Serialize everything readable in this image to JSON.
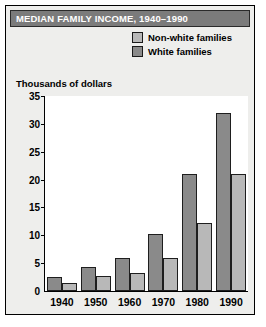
{
  "title": "MEDIAN FAMILY INCOME, 1940–1990",
  "legend": {
    "items": [
      {
        "label": "Non-white families",
        "color": "#b8b8b8"
      },
      {
        "label": "White families",
        "color": "#8a8a8a"
      }
    ]
  },
  "axis": {
    "ylabel": "Thousands of dollars",
    "yticks": [
      "0",
      "5",
      "10",
      "15",
      "20",
      "25",
      "30",
      "35"
    ]
  },
  "chart_data": {
    "type": "bar",
    "title": "MEDIAN FAMILY INCOME, 1940–1990",
    "xlabel": "",
    "ylabel": "Thousands of dollars",
    "ylim": [
      0,
      35
    ],
    "ytick_step": 5,
    "grid": false,
    "legend_position": "top-right",
    "bar_order_within_group": [
      "White families",
      "Non-white families"
    ],
    "categories": [
      "1940",
      "1950",
      "1960",
      "1970",
      "1980",
      "1990"
    ],
    "series": [
      {
        "name": "White families",
        "color": "#8a8a8a",
        "values": [
          2.5,
          4.3,
          6.0,
          10.2,
          21.0,
          32.0
        ]
      },
      {
        "name": "Non-white families",
        "color": "#b8b8b8",
        "values": [
          1.5,
          2.7,
          3.3,
          6.0,
          12.2,
          21.0
        ]
      }
    ]
  }
}
